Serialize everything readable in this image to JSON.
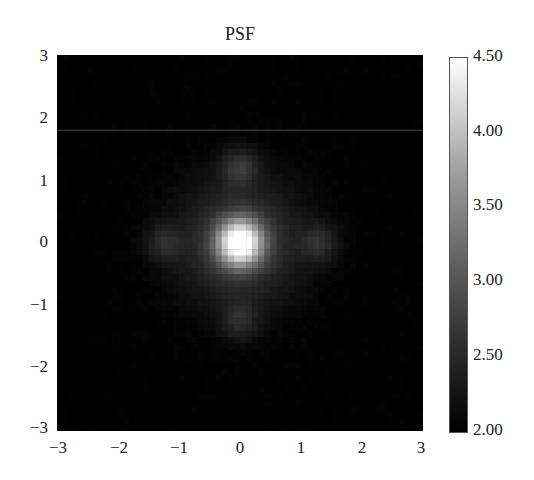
{
  "chart_data": {
    "type": "heatmap",
    "title": "PSF",
    "xlabel": "",
    "ylabel": "",
    "xlim": [
      -3,
      3
    ],
    "ylim": [
      -3,
      3
    ],
    "xticks": [
      "−3",
      "−2",
      "−1",
      "0",
      "1",
      "2",
      "3"
    ],
    "yticks": [
      "3",
      "2",
      "1",
      "0",
      "−1",
      "−2",
      "−3"
    ],
    "colormap": "gray",
    "colorbar": {
      "range": [
        2.0,
        4.5
      ],
      "ticks": [
        "4.50",
        "4.00",
        "3.50",
        "3.00",
        "2.50",
        "2.00"
      ]
    },
    "grid": false,
    "features": [
      {
        "name": "central-peak",
        "x": 0.0,
        "y": 0.0,
        "value": 4.5,
        "size": 0.35
      },
      {
        "name": "lobe-top",
        "x": 0.0,
        "y": 1.2,
        "value": 2.45,
        "size": 0.3
      },
      {
        "name": "lobe-bottom",
        "x": 0.0,
        "y": -1.25,
        "value": 2.35,
        "size": 0.3
      },
      {
        "name": "lobe-left",
        "x": -1.25,
        "y": 0.0,
        "value": 2.35,
        "size": 0.3
      },
      {
        "name": "lobe-right",
        "x": 1.3,
        "y": 0.0,
        "value": 2.4,
        "size": 0.3
      },
      {
        "name": "diffuse-halo",
        "x": 0.0,
        "y": 0.0,
        "value": 2.6,
        "size": 1.0
      }
    ],
    "artifact_line_y": 1.8
  }
}
